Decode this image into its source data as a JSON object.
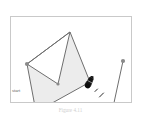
{
  "app": {
    "title": "polygon-drawing-canvas",
    "background_color": "#ffffff"
  },
  "canvas": {
    "name": "drawing-canvas",
    "border_color": "#c9c9c9",
    "fill_color": "#ececec",
    "stroke_color": "#6e6e6e",
    "vertex_color": "#8a8a8a",
    "width": 122,
    "height": 87
  },
  "labels": {
    "start": "start",
    "caption": "Figure 4.11"
  },
  "cursor": {
    "name": "pen-cursor",
    "color": "#1a1a1a",
    "x": 80,
    "y": 66
  },
  "shapes": {
    "polygon": {
      "name": "zigzag-polygon",
      "closed": true,
      "points": [
        {
          "x": 17,
          "y": 48
        },
        {
          "x": 60,
          "y": 16
        },
        {
          "x": 48,
          "y": 68
        },
        {
          "x": 17,
          "y": 48
        },
        {
          "x": 26,
          "y": 96
        },
        {
          "x": 80,
          "y": 66
        },
        {
          "x": 60,
          "y": 16
        }
      ],
      "path": "M 17 48 L 60 16 L 48 68 L 17 48 L 26 96 L 80 66 L 60 16 Z",
      "vertices": [
        {
          "name": "vertex-upper-left",
          "x": 17,
          "y": 48
        },
        {
          "name": "vertex-apex",
          "x": 60,
          "y": 16
        },
        {
          "name": "vertex-valley",
          "x": 48,
          "y": 68
        },
        {
          "name": "vertex-start",
          "x": 26,
          "y": 96
        },
        {
          "name": "vertex-cursor-end",
          "x": 80,
          "y": 66
        }
      ]
    },
    "segment": {
      "name": "standalone-segment",
      "x1": 113,
      "y1": 45,
      "x2": 102,
      "y2": 96,
      "endpoints": [
        {
          "name": "segment-endpoint-top",
          "x": 113,
          "y": 45
        },
        {
          "name": "segment-endpoint-bottom",
          "x": 102,
          "y": 96
        }
      ]
    },
    "dashes": {
      "name": "drag-trail-dashes",
      "marks": [
        {
          "x1": 85,
          "y1": 75,
          "x2": 88,
          "y2": 72
        },
        {
          "x1": 89,
          "y1": 81,
          "x2": 94,
          "y2": 76
        }
      ]
    }
  }
}
